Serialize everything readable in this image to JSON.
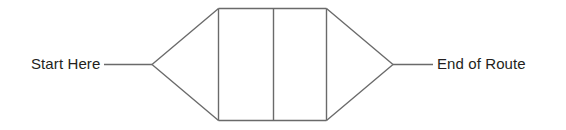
{
  "diagram": {
    "background_color": "#ffffff",
    "line_color": "#6a6a6a",
    "text_color": "#231f20",
    "labels": {
      "start": "Start Here",
      "end": "End of Route"
    },
    "shape": {
      "name": "hexagonal-route-body",
      "description": "Elongated hexagon with two internal compartments divided by a vertical line",
      "left_apex": {
        "x": 152,
        "y": 64
      },
      "right_apex": {
        "x": 393,
        "y": 64
      },
      "body_left": 218,
      "body_right": 326,
      "body_top": 8,
      "body_bottom": 120,
      "divider_x": 273
    },
    "leaders": {
      "start_leader": {
        "x1": 104,
        "y1": 64,
        "x2": 152,
        "y2": 64
      },
      "end_leader": {
        "x1": 393,
        "y1": 64,
        "x2": 433,
        "y2": 64
      }
    }
  }
}
